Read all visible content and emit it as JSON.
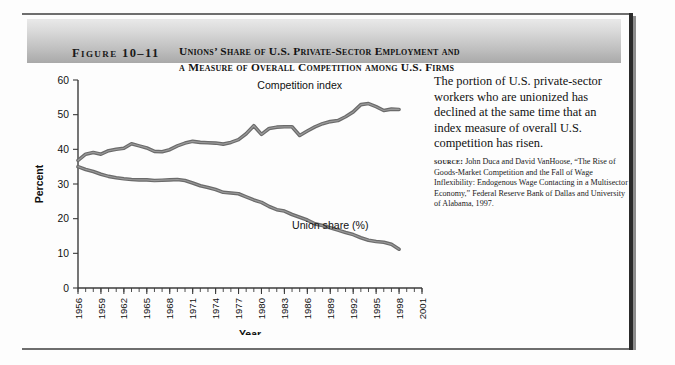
{
  "figure": {
    "label": "Figure 10–11",
    "title_line1": "Unions’ Share of U.S. Private-Sector Employment and",
    "title_line2": "a Measure of Overall Competition among U.S. Firms"
  },
  "caption": {
    "body": "The portion of U.S. private-sector workers who are unionized has declined at the same time that an index measure of overall U.S. competition has risen.",
    "source_kicker": "source:",
    "source_text": " John Duca and David VanHoose, “The Rise of Goods-Market Competition and the Fall of Wage Inflexibility: Endogenous Wage Contacting in a Multisector Economy,” Federal Reserve Bank of Dallas and University of Alabama, 1997."
  },
  "chart_data": {
    "type": "line",
    "title": "",
    "xlabel": "Year",
    "ylabel": "Percent",
    "ylim": [
      0,
      60
    ],
    "yticks": [
      0,
      10,
      20,
      30,
      40,
      50,
      60
    ],
    "xlim": [
      1956,
      2001
    ],
    "xticks": [
      1956,
      1959,
      1962,
      1965,
      1968,
      1971,
      1974,
      1977,
      1980,
      1983,
      1986,
      1989,
      1992,
      1995,
      1998,
      2001
    ],
    "grid": false,
    "legend_position": "inline-annotation",
    "x": [
      1956,
      1957,
      1958,
      1959,
      1960,
      1961,
      1962,
      1963,
      1964,
      1965,
      1966,
      1967,
      1968,
      1969,
      1970,
      1971,
      1972,
      1973,
      1974,
      1975,
      1976,
      1977,
      1978,
      1979,
      1980,
      1981,
      1982,
      1983,
      1984,
      1985,
      1986,
      1987,
      1988,
      1989,
      1990,
      1991,
      1992,
      1993,
      1994,
      1995,
      1996,
      1997,
      1998
    ],
    "series": [
      {
        "name": "Competition index",
        "color": "#6b6b6b",
        "values": [
          36.8,
          38.6,
          39.1,
          38.6,
          39.6,
          40.0,
          40.3,
          41.6,
          41.0,
          40.4,
          39.4,
          39.3,
          39.9,
          41.0,
          41.8,
          42.3,
          42.0,
          41.9,
          41.8,
          41.5,
          42.0,
          42.8,
          44.5,
          46.8,
          44.3,
          46.0,
          46.4,
          46.5,
          46.5,
          44.0,
          45.3,
          46.5,
          47.4,
          48.0,
          48.3,
          49.4,
          50.8,
          52.9,
          53.2,
          52.3,
          51.2,
          51.6,
          51.5
        ]
      },
      {
        "name": "Union share (%)",
        "color": "#6b6b6b",
        "values": [
          35.0,
          34.2,
          33.6,
          32.8,
          32.2,
          31.8,
          31.5,
          31.3,
          31.2,
          31.2,
          31.0,
          31.1,
          31.2,
          31.3,
          31.0,
          30.3,
          29.5,
          29.0,
          28.4,
          27.6,
          27.4,
          27.2,
          26.3,
          25.4,
          24.7,
          23.5,
          22.6,
          22.2,
          21.2,
          20.4,
          19.6,
          18.5,
          18.0,
          17.4,
          16.7,
          16.0,
          15.4,
          14.5,
          13.8,
          13.4,
          13.2,
          12.6,
          11.2
        ]
      }
    ],
    "annotations": [
      {
        "text": "Competition index",
        "x": 1985,
        "y": 57.5
      },
      {
        "text": "Union share (%)",
        "x": 1989,
        "y": 17.0
      }
    ]
  }
}
